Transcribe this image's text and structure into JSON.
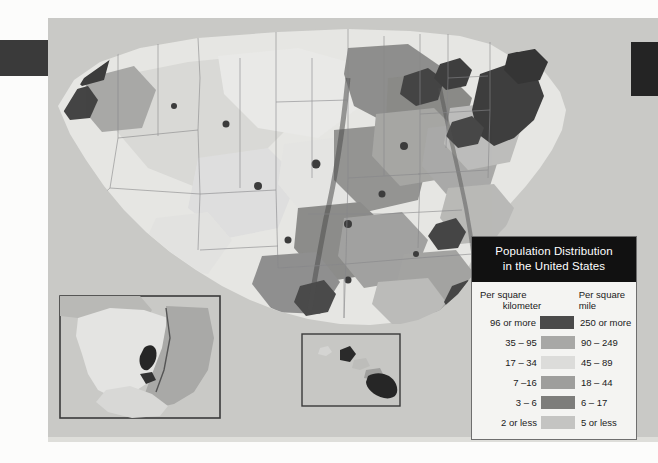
{
  "document": {
    "kind": "scanned-textbook-map-plate"
  },
  "legend": {
    "title_line1": "Population Distribution",
    "title_line2": "in the United States",
    "header_left_line1": "Per square",
    "header_left_line2": "kilometer",
    "header_right_line1": "Per square",
    "header_right_line2": "mile",
    "rows": [
      {
        "per_km": "96 or more",
        "per_mile": "250 or more",
        "color": "#4a4a4a"
      },
      {
        "per_km": "35 – 95",
        "per_mile": "90 – 249",
        "color": "#a8a8a6"
      },
      {
        "per_km": "17 – 34",
        "per_mile": "45 – 89",
        "color": "#dcdcda"
      },
      {
        "per_km": "7 –16",
        "per_mile": "18 – 44",
        "color": "#9e9e9c"
      },
      {
        "per_km": "3 – 6",
        "per_mile": "6 – 17",
        "color": "#7d7d7b"
      },
      {
        "per_km": "2 or less",
        "per_mile": "5 or less",
        "color": "#c4c4c2"
      }
    ]
  },
  "map": {
    "ocean_color": "#c9c9c6",
    "land_base_color": "#e8e8e5",
    "border_color": "#8a8a88",
    "insets": [
      {
        "name": "alaska",
        "label": ""
      },
      {
        "name": "hawaii",
        "label": ""
      }
    ]
  },
  "chart_data": {
    "type": "choropleth",
    "title": "Population Distribution in the United States",
    "region": "United States",
    "variable": "Population density",
    "units": [
      "per square kilometer",
      "per square mile"
    ],
    "legend_position": "bottom-right",
    "classes": [
      {
        "rank": 1,
        "per_km": "96 or more",
        "per_mile": "250 or more",
        "km_min": 96,
        "km_max": null,
        "mi_min": 250,
        "mi_max": null,
        "color": "#4a4a4a"
      },
      {
        "rank": 2,
        "per_km": "35 – 95",
        "per_mile": "90 – 249",
        "km_min": 35,
        "km_max": 95,
        "mi_min": 90,
        "mi_max": 249,
        "color": "#a8a8a6"
      },
      {
        "rank": 3,
        "per_km": "17 – 34",
        "per_mile": "45 – 89",
        "km_min": 17,
        "km_max": 34,
        "mi_min": 45,
        "mi_max": 89,
        "color": "#dcdcda"
      },
      {
        "rank": 4,
        "per_km": "7 –16",
        "per_mile": "18 – 44",
        "km_min": 7,
        "km_max": 16,
        "mi_min": 18,
        "mi_max": 44,
        "color": "#9e9e9c"
      },
      {
        "rank": 5,
        "per_km": "3 – 6",
        "per_mile": "6 – 17",
        "km_min": 3,
        "km_max": 6,
        "mi_min": 6,
        "mi_max": 17,
        "color": "#7d7d7b"
      },
      {
        "rank": 6,
        "per_km": "2 or less",
        "per_mile": "5 or less",
        "km_min": null,
        "km_max": 2,
        "mi_min": null,
        "mi_max": 5,
        "color": "#c4c4c2"
      }
    ],
    "insets": [
      "Alaska",
      "Hawaii"
    ]
  }
}
